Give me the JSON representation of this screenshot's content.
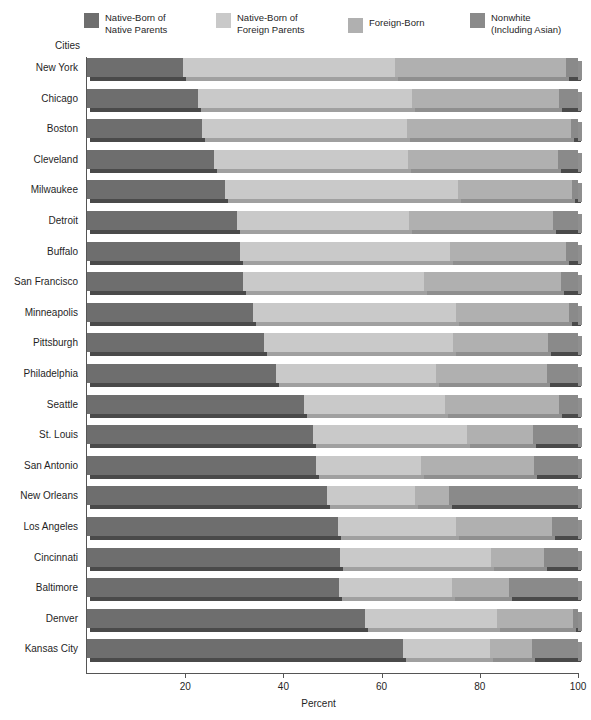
{
  "colors": {
    "native_born_native_parents": "#6e6e6e",
    "native_born_foreign_parents": "#c9c9c9",
    "foreign_born": "#b0b0b0",
    "nonwhite": "#8a8a8a",
    "shadow_dark": "#4a4a4a",
    "shadow_mid": "#8f8f8f",
    "shadow_light": "#a0a0a0",
    "axis": "#555555",
    "text": "#1f1f1f",
    "background": "#ffffff"
  },
  "legend": {
    "items": [
      {
        "label": "Native-Born of\nNative Parents",
        "swatch": "native_born_native_parents"
      },
      {
        "label": "Native-Born of\nForeign Parents",
        "swatch": "native_born_foreign_parents"
      },
      {
        "label": "Foreign-Born",
        "swatch": "foreign_born"
      },
      {
        "label": "Nonwhite\n(Including Asian)",
        "swatch": "nonwhite"
      }
    ]
  },
  "axis": {
    "y_title": "Cities",
    "x_title": "Percent",
    "x_ticks": [
      20,
      40,
      60,
      80,
      100
    ],
    "x_tick_labels": [
      "20",
      "40",
      "60",
      "80",
      "100"
    ],
    "xlim": [
      0,
      100
    ]
  },
  "chart_data": {
    "type": "bar",
    "orientation": "horizontal",
    "stacked": true,
    "title": "",
    "xlabel": "Percent",
    "ylabel": "Cities",
    "xlim": [
      0,
      100
    ],
    "grid": false,
    "legend_position": "top",
    "categories": [
      "New York",
      "Chicago",
      "Boston",
      "Cleveland",
      "Milwaukee",
      "Detroit",
      "Buffalo",
      "San Francisco",
      "Minneapolis",
      "Pittsburgh",
      "Philadelphia",
      "Seattle",
      "St. Louis",
      "San Antonio",
      "New Orleans",
      "Los Angeles",
      "Cincinnati",
      "Baltimore",
      "Denver",
      "Kansas City"
    ],
    "series": [
      {
        "name": "Native-Born of Native Parents",
        "values": [
          19.5,
          22.6,
          23.4,
          25.9,
          28.1,
          30.5,
          31.2,
          31.8,
          33.8,
          36.1,
          38.5,
          44.2,
          46.0,
          46.6,
          48.9,
          51.1,
          51.5,
          51.3,
          56.6,
          64.4
        ]
      },
      {
        "name": "Native-Born of Foreign Parents",
        "values": [
          43.2,
          43.6,
          41.8,
          39.5,
          47.5,
          35.1,
          42.7,
          36.8,
          41.4,
          38.5,
          32.6,
          28.7,
          31.4,
          21.4,
          17.9,
          24.1,
          30.8,
          23.0,
          26.9,
          17.7
        ]
      },
      {
        "name": "Foreign-Born",
        "values": [
          34.9,
          29.9,
          33.4,
          30.5,
          23.2,
          29.3,
          23.7,
          27.9,
          23.0,
          19.3,
          22.6,
          23.2,
          13.4,
          23.0,
          6.9,
          19.5,
          10.8,
          11.7,
          15.5,
          8.5
        ]
      },
      {
        "name": "Nonwhite (Including Asian)",
        "values": [
          2.4,
          3.9,
          1.4,
          4.1,
          1.2,
          5.1,
          2.4,
          3.5,
          1.8,
          6.1,
          6.3,
          3.9,
          9.2,
          9.0,
          26.3,
          5.3,
          6.9,
          14.0,
          1.0,
          9.4
        ]
      }
    ],
    "boundaries_percent": [
      {
        "city": "New York",
        "b1": 19.5,
        "b2": 62.7,
        "b3": 97.6
      },
      {
        "city": "Chicago",
        "b1": 22.6,
        "b2": 66.2,
        "b3": 96.1
      },
      {
        "city": "Boston",
        "b1": 23.4,
        "b2": 65.2,
        "b3": 98.6
      },
      {
        "city": "Cleveland",
        "b1": 25.9,
        "b2": 65.4,
        "b3": 95.9
      },
      {
        "city": "Milwaukee",
        "b1": 28.1,
        "b2": 75.6,
        "b3": 98.8
      },
      {
        "city": "Detroit",
        "b1": 30.5,
        "b2": 65.6,
        "b3": 94.9
      },
      {
        "city": "Buffalo",
        "b1": 31.2,
        "b2": 73.9,
        "b3": 97.6
      },
      {
        "city": "San Francisco",
        "b1": 31.8,
        "b2": 68.6,
        "b3": 96.5
      },
      {
        "city": "Minneapolis",
        "b1": 33.8,
        "b2": 75.2,
        "b3": 98.2
      },
      {
        "city": "Pittsburgh",
        "b1": 36.1,
        "b2": 74.6,
        "b3": 93.9
      },
      {
        "city": "Philadelphia",
        "b1": 38.5,
        "b2": 71.1,
        "b3": 93.7
      },
      {
        "city": "Seattle",
        "b1": 44.2,
        "b2": 72.9,
        "b3": 96.1
      },
      {
        "city": "St. Louis",
        "b1": 46.0,
        "b2": 77.4,
        "b3": 90.8
      },
      {
        "city": "San Antonio",
        "b1": 46.6,
        "b2": 68.0,
        "b3": 91.0
      },
      {
        "city": "New Orleans",
        "b1": 48.9,
        "b2": 66.8,
        "b3": 73.7
      },
      {
        "city": "Los Angeles",
        "b1": 51.1,
        "b2": 75.2,
        "b3": 94.7
      },
      {
        "city": "Cincinnati",
        "b1": 51.5,
        "b2": 82.3,
        "b3": 93.1
      },
      {
        "city": "Baltimore",
        "b1": 51.3,
        "b2": 74.3,
        "b3": 86.0
      },
      {
        "city": "Denver",
        "b1": 56.6,
        "b2": 83.5,
        "b3": 99.0
      },
      {
        "city": "Kansas City",
        "b1": 64.4,
        "b2": 82.1,
        "b3": 90.6
      }
    ]
  }
}
